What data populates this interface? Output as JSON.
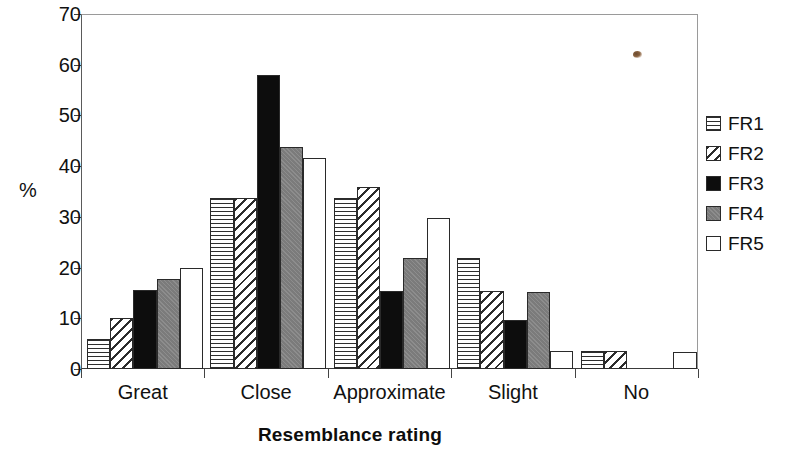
{
  "chart_data": {
    "type": "bar",
    "title": "",
    "subtitle": "",
    "xlabel": "Resemblance rating",
    "ylabel": "%",
    "categories": [
      "Great",
      "Close",
      "Approximate",
      "Slight",
      "No"
    ],
    "series": [
      {
        "name": "FR1",
        "pattern": "horizontal-lines",
        "color": "#ffffff",
        "values": [
          6.0,
          33.8,
          33.8,
          21.8,
          3.5
        ]
      },
      {
        "name": "FR2",
        "pattern": "diagonal-hatch",
        "color": "#ffffff",
        "values": [
          10.0,
          33.8,
          35.8,
          15.4,
          3.5
        ]
      },
      {
        "name": "FR3",
        "pattern": "solid-black",
        "color": "#0d0d0d",
        "values": [
          15.6,
          58.0,
          15.4,
          9.6,
          0
        ]
      },
      {
        "name": "FR4",
        "pattern": "solid-gray",
        "color": "#808080",
        "values": [
          17.8,
          43.7,
          21.8,
          15.2,
          0
        ]
      },
      {
        "name": "FR5",
        "pattern": "solid-white",
        "color": "#ffffff",
        "values": [
          19.9,
          41.7,
          29.7,
          3.5,
          3.4
        ]
      }
    ],
    "ylim": [
      0,
      70
    ],
    "ytick_step": 10,
    "ytick_labels": [
      "0",
      "10",
      "20",
      "30",
      "40",
      "50",
      "60",
      "70"
    ],
    "grid": false,
    "legend_position": "right",
    "legend_entries": [
      "FR1",
      "FR2",
      "FR3",
      "FR4",
      "FR5"
    ]
  },
  "axes": {
    "y_axis_label": "%",
    "x_axis_title": "Resemblance rating"
  },
  "artifact": {
    "name": "scan-speck",
    "color": "#7a5634"
  }
}
